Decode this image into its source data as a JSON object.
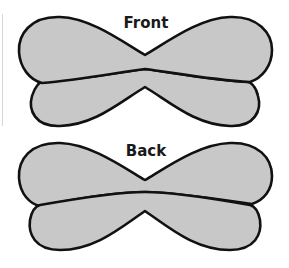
{
  "diagram": {
    "front": {
      "label": "Front"
    },
    "back": {
      "label": "Back"
    },
    "colors": {
      "fill": "#c8c8c8",
      "stroke": "#111111",
      "background": "#ffffff"
    }
  }
}
